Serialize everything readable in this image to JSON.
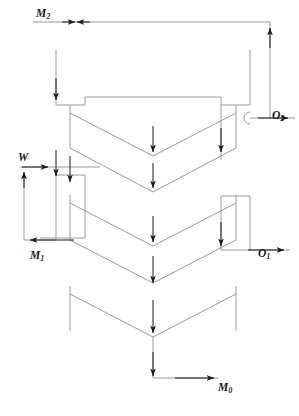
{
  "diagram": {
    "type": "process-flow-diagram",
    "line_color": "#9a9a9a",
    "arrow_color": "#1a1a1a",
    "label_color": "#1a1a1a",
    "background": "#ffffff",
    "stream_labels": [
      {
        "id": "M2",
        "base": "M",
        "sub": "2",
        "x": 36,
        "y": 8,
        "role": "feed-inlet-top-left"
      },
      {
        "id": "O2",
        "base": "O",
        "sub": "2",
        "x": 272,
        "y": 110,
        "role": "outlet-right-upper"
      },
      {
        "id": "W",
        "base": "W",
        "sub": "",
        "x": 18,
        "y": 152,
        "role": "wash-inlet-left"
      },
      {
        "id": "M1",
        "base": "M",
        "sub": "1",
        "x": 30,
        "y": 250,
        "role": "outlet-left-lower"
      },
      {
        "id": "O1",
        "base": "O",
        "sub": "1",
        "x": 258,
        "y": 248,
        "role": "outlet-right-lower"
      },
      {
        "id": "M0",
        "base": "M",
        "sub": "0",
        "x": 218,
        "y": 382,
        "role": "product-outlet-bottom"
      }
    ],
    "stages": [
      {
        "name": "stage-1",
        "label": "upper-hopper"
      },
      {
        "name": "stage-2",
        "label": "middle-hopper"
      },
      {
        "name": "stage-3",
        "label": "lower-hopper"
      }
    ]
  }
}
